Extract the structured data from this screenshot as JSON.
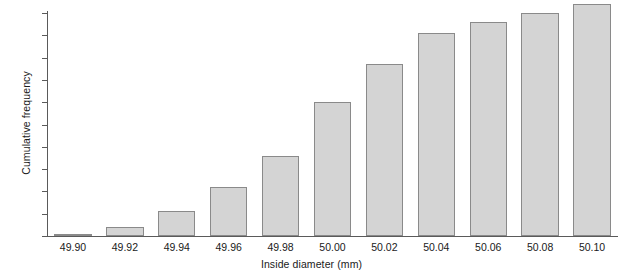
{
  "chart_data": {
    "type": "bar",
    "title": "",
    "subtitle": "",
    "xlabel": "Inside diameter (mm)",
    "ylabel": "Cumulative frequency",
    "categories": [
      "49.90",
      "49.92",
      "49.94",
      "49.96",
      "49.98",
      "50.00",
      "50.02",
      "50.04",
      "50.06",
      "50.08",
      "50.10"
    ],
    "values": [
      1,
      4,
      11,
      22,
      36,
      60,
      77,
      91,
      96,
      100,
      104
    ],
    "series": [
      {
        "name": "Cumulative frequency",
        "values": [
          1,
          4,
          11,
          22,
          36,
          60,
          77,
          91,
          96,
          100,
          104
        ]
      }
    ],
    "ylim": [
      0,
      104
    ],
    "yticks": [
      0,
      10,
      20,
      30,
      40,
      50,
      60,
      70,
      80,
      90,
      100
    ],
    "ytick_labels": [
      "0",
      "10",
      "20",
      "30",
      "40",
      "50",
      "60",
      "70",
      "80",
      "90",
      "100"
    ],
    "grid": false,
    "legend": false,
    "legend_position": "none",
    "annotations": []
  },
  "style": {
    "bar_fill": "#d4d4d4",
    "bar_border": "#8a8a8a",
    "axis_color": "#5a5a5a",
    "text_color": "#1a1a1a",
    "background": "#ffffff"
  }
}
